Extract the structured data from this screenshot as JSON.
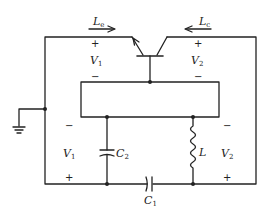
{
  "diagram": {
    "type": "circuit-schematic",
    "colors": {
      "line": "#222222",
      "background": "#ffffff"
    },
    "labels": {
      "emitter_current": {
        "main": "L",
        "sub": "e"
      },
      "collector_current": {
        "main": "L",
        "sub": "c"
      },
      "v1_top": {
        "main": "V",
        "sub": "1",
        "plus": "+",
        "minus": "−"
      },
      "v2_top": {
        "main": "V",
        "sub": "2",
        "plus": "+",
        "minus": "−"
      },
      "v1_bottom": {
        "main": "V",
        "sub": "1",
        "plus": "+",
        "minus": "−"
      },
      "v2_bottom": {
        "main": "V",
        "sub": "2",
        "plus": "+",
        "minus": "−"
      },
      "c1": {
        "main": "C",
        "sub": "1"
      },
      "c2": {
        "main": "C",
        "sub": "2"
      },
      "inductor": {
        "main": "L"
      }
    },
    "components": [
      {
        "id": "Q",
        "kind": "bipolar-transistor",
        "label": ""
      },
      {
        "id": "box",
        "kind": "two-port-network",
        "label": ""
      },
      {
        "id": "C1",
        "kind": "capacitor",
        "label": "C1"
      },
      {
        "id": "C2",
        "kind": "capacitor",
        "label": "C2"
      },
      {
        "id": "L",
        "kind": "inductor",
        "label": "L"
      },
      {
        "id": "GND",
        "kind": "ground",
        "label": ""
      }
    ]
  }
}
